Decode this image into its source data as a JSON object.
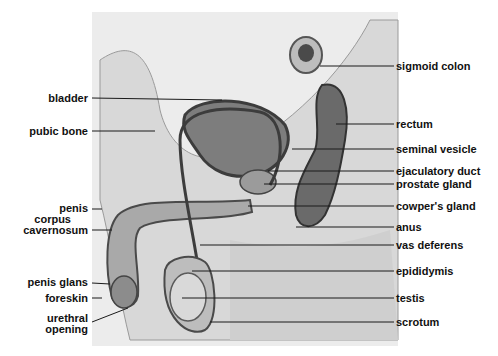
{
  "diagram": {
    "left_labels": [
      {
        "text": "bladder",
        "x": 88,
        "y": 98,
        "tx": 222,
        "ty": 100
      },
      {
        "text": "pubic bone",
        "x": 88,
        "y": 131,
        "tx": 155,
        "ty": 131
      },
      {
        "text": "penis",
        "x": 88,
        "y": 208,
        "tx": 102,
        "ty": 208
      },
      {
        "text": "corpus",
        "x": 0,
        "y": 216,
        "tx": 0,
        "ty": 0
      },
      {
        "text": "cavernosum",
        "x": 88,
        "y": 230,
        "tx": 112,
        "ty": 230
      },
      {
        "text": "penis glans",
        "x": 88,
        "y": 282,
        "tx": 110,
        "ty": 284
      },
      {
        "text": "foreskin",
        "x": 88,
        "y": 298,
        "tx": 102,
        "ty": 298
      },
      {
        "text": "urethral",
        "x": 0,
        "y": 316,
        "tx": 0,
        "ty": 0
      },
      {
        "text": "opening",
        "x": 88,
        "y": 328,
        "tx": 128,
        "ty": 308
      }
    ],
    "right_labels": [
      {
        "text": "sigmoid colon",
        "x": 396,
        "y": 66,
        "tx": 320,
        "ty": 66
      },
      {
        "text": "rectum",
        "x": 396,
        "y": 124,
        "tx": 336,
        "ty": 124
      },
      {
        "text": "seminal vesicle",
        "x": 396,
        "y": 149,
        "tx": 292,
        "ty": 149
      },
      {
        "text": "ejaculatory duct",
        "x": 396,
        "y": 171,
        "tx": 268,
        "ty": 171
      },
      {
        "text": "prostate gland",
        "x": 396,
        "y": 184,
        "tx": 264,
        "ty": 184
      },
      {
        "text": "cowper's gland",
        "x": 396,
        "y": 206,
        "tx": 248,
        "ty": 206
      },
      {
        "text": "anus",
        "x": 396,
        "y": 227,
        "tx": 296,
        "ty": 227
      },
      {
        "text": "vas deferens",
        "x": 396,
        "y": 245,
        "tx": 200,
        "ty": 245
      },
      {
        "text": "epididymis",
        "x": 396,
        "y": 271,
        "tx": 192,
        "ty": 271
      },
      {
        "text": "testis",
        "x": 396,
        "y": 298,
        "tx": 182,
        "ty": 298
      },
      {
        "text": "scrotum",
        "x": 396,
        "y": 322,
        "tx": 210,
        "ty": 322
      }
    ]
  },
  "labels": {
    "bladder": "bladder",
    "pubic_bone": "pubic bone",
    "penis": "penis",
    "corpus": "corpus",
    "cavernosum": "cavernosum",
    "penis_glans": "penis glans",
    "foreskin": "foreskin",
    "urethral": "urethral",
    "opening": "opening",
    "sigmoid_colon": "sigmoid colon",
    "rectum": "rectum",
    "seminal_vesicle": "seminal vesicle",
    "ejaculatory_duct": "ejaculatory duct",
    "prostate_gland": "prostate gland",
    "cowpers_gland": "cowper's gland",
    "anus": "anus",
    "vas_deferens": "vas deferens",
    "epididymis": "epididymis",
    "testis": "testis",
    "scrotum": "scrotum"
  },
  "colors": {
    "background": "#ffffff",
    "panel": "#e8e8e8",
    "tissue_light": "#d6d6d6",
    "tissue_mid": "#a8a8a8",
    "tissue_dark": "#5a5a5a",
    "leader_line": "#1a1a1a",
    "text": "#111111"
  }
}
